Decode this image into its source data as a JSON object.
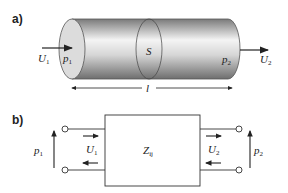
{
  "part_a": {
    "label": "a)",
    "inlet_velocity": "U",
    "inlet_velocity_sub": "1",
    "inlet_pressure": "p",
    "inlet_pressure_sub": "1",
    "section": "S",
    "outlet_pressure": "p",
    "outlet_pressure_sub": "2",
    "outlet_velocity": "U",
    "outlet_velocity_sub": "2",
    "length": "l"
  },
  "part_b": {
    "label": "b)",
    "impedance": "Z",
    "impedance_sub": "ij",
    "left_pressure": "p",
    "left_pressure_sub": "1",
    "left_velocity": "U",
    "left_velocity_sub": "1",
    "right_velocity": "U",
    "right_velocity_sub": "2",
    "right_pressure": "p",
    "right_pressure_sub": "2"
  },
  "colors": {
    "line": "#222222",
    "cylinder_light": "#f2f2f2",
    "cylinder_dark": "#8a8a8a",
    "end_cap": "#d9d9d9"
  }
}
